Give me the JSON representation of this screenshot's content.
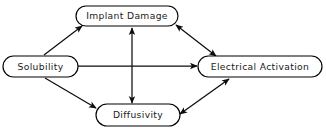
{
  "diagram": {
    "background_color": "#ffffff",
    "stroke_color": "#000000",
    "text_color": "#1a1a1a",
    "node_shape": "rounded-rectangle",
    "nodes": [
      {
        "id": "implant-damage",
        "label": "Implant Damage",
        "position": "top",
        "x": 76,
        "y": 6,
        "w": 102,
        "h": 20
      },
      {
        "id": "solubility",
        "label": "Solubility",
        "position": "left",
        "x": 3,
        "y": 56,
        "w": 75,
        "h": 21
      },
      {
        "id": "electrical-activation",
        "label": "Electrical Activation",
        "position": "right",
        "x": 198,
        "y": 56,
        "w": 124,
        "h": 21
      },
      {
        "id": "diffusivity",
        "label": "Diffusivity",
        "position": "bottom",
        "x": 96,
        "y": 104,
        "w": 84,
        "h": 22
      }
    ],
    "edges": [
      {
        "id": "solubility-to-implant-damage",
        "from": "solubility",
        "to": "implant-damage",
        "arrows": "single",
        "direction": "forward",
        "x1": 44,
        "y1": 55,
        "x2": 82,
        "y2": 26
      },
      {
        "id": "solubility-to-electrical-activation",
        "from": "solubility",
        "to": "electrical-activation",
        "arrows": "single",
        "direction": "forward",
        "x1": 78,
        "y1": 66,
        "x2": 197,
        "y2": 66
      },
      {
        "id": "solubility-to-diffusivity",
        "from": "solubility",
        "to": "diffusivity",
        "arrows": "single",
        "direction": "forward",
        "x1": 45,
        "y1": 77,
        "x2": 96,
        "y2": 108
      },
      {
        "id": "implant-damage-to-electrical-activation",
        "from": "implant-damage",
        "to": "electrical-activation",
        "arrows": "double",
        "direction": "both",
        "x1": 175,
        "y1": 25,
        "x2": 215,
        "y2": 55
      },
      {
        "id": "implant-damage-to-diffusivity",
        "from": "implant-damage",
        "to": "diffusivity",
        "arrows": "double",
        "direction": "both",
        "x1": 132,
        "y1": 27,
        "x2": 132,
        "y2": 103
      },
      {
        "id": "diffusivity-to-electrical-activation",
        "from": "diffusivity",
        "to": "electrical-activation",
        "arrows": "double",
        "direction": "both",
        "x1": 179,
        "y1": 113,
        "x2": 228,
        "y2": 78
      }
    ]
  }
}
